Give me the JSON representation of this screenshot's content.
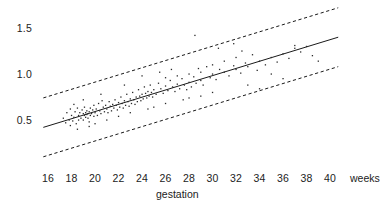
{
  "chart_data": {
    "type": "scatter",
    "title": "",
    "xlabel": "gestation",
    "ylabel": "",
    "x_unit_label": "weeks",
    "xlim": [
      15,
      41.5
    ],
    "ylim": [
      0.2,
      1.62
    ],
    "grid": false,
    "legend": "none",
    "xticks": [
      16,
      18,
      20,
      22,
      24,
      26,
      28,
      30,
      32,
      34,
      36,
      38,
      40
    ],
    "xtick_labels": [
      "16",
      "18",
      "20",
      "22",
      "24",
      "26",
      "28",
      "30",
      "32",
      "34",
      "36",
      "38",
      "40"
    ],
    "yticks": [
      0.5,
      1.0,
      1.5
    ],
    "ytick_labels": [
      "0.5",
      "1.0",
      "1.5"
    ],
    "series": [
      {
        "name": "observations",
        "type": "scatter",
        "marker": "dot",
        "points": [
          [
            17.3,
            0.52
          ],
          [
            17.5,
            0.47
          ],
          [
            17.6,
            0.58
          ],
          [
            17.8,
            0.5
          ],
          [
            17.9,
            0.62
          ],
          [
            17.9,
            0.44
          ],
          [
            18.0,
            0.55
          ],
          [
            18.1,
            0.49
          ],
          [
            18.2,
            0.67
          ],
          [
            18.2,
            0.53
          ],
          [
            18.3,
            0.59
          ],
          [
            18.4,
            0.46
          ],
          [
            18.5,
            0.63
          ],
          [
            18.6,
            0.55
          ],
          [
            18.6,
            0.5
          ],
          [
            18.7,
            0.58
          ],
          [
            18.8,
            0.52
          ],
          [
            18.9,
            0.61
          ],
          [
            19.0,
            0.57
          ],
          [
            19.0,
            0.5
          ],
          [
            19.1,
            0.64
          ],
          [
            19.1,
            0.55
          ],
          [
            19.2,
            0.58
          ],
          [
            19.2,
            0.53
          ],
          [
            19.3,
            0.6
          ],
          [
            19.3,
            0.56
          ],
          [
            19.4,
            0.57
          ],
          [
            19.4,
            0.52
          ],
          [
            19.5,
            0.59
          ],
          [
            19.5,
            0.48
          ],
          [
            19.6,
            0.63
          ],
          [
            19.6,
            0.55
          ],
          [
            19.7,
            0.57
          ],
          [
            19.8,
            0.61
          ],
          [
            19.9,
            0.54
          ],
          [
            19.9,
            0.66
          ],
          [
            20.0,
            0.58
          ],
          [
            20.1,
            0.62
          ],
          [
            20.2,
            0.55
          ],
          [
            20.3,
            0.68
          ],
          [
            20.4,
            0.6
          ],
          [
            20.5,
            0.57
          ],
          [
            20.6,
            0.71
          ],
          [
            20.7,
            0.64
          ],
          [
            20.8,
            0.59
          ],
          [
            20.9,
            0.66
          ],
          [
            21.0,
            0.62
          ],
          [
            21.1,
            0.58
          ],
          [
            21.2,
            0.7
          ],
          [
            21.3,
            0.65
          ],
          [
            21.4,
            0.6
          ],
          [
            21.5,
            0.67
          ],
          [
            21.6,
            0.63
          ],
          [
            21.7,
            0.72
          ],
          [
            21.8,
            0.66
          ],
          [
            21.9,
            0.61
          ],
          [
            22.0,
            0.69
          ],
          [
            22.1,
            0.64
          ],
          [
            22.2,
            0.75
          ],
          [
            22.3,
            0.68
          ],
          [
            22.4,
            0.63
          ],
          [
            22.5,
            0.71
          ],
          [
            22.6,
            0.66
          ],
          [
            22.7,
            0.78
          ],
          [
            22.8,
            0.7
          ],
          [
            22.9,
            0.65
          ],
          [
            23.0,
            0.73
          ],
          [
            23.1,
            0.68
          ],
          [
            23.2,
            0.8
          ],
          [
            23.3,
            0.72
          ],
          [
            23.4,
            0.67
          ],
          [
            23.5,
            0.75
          ],
          [
            23.6,
            0.7
          ],
          [
            23.7,
            0.83
          ],
          [
            23.8,
            0.76
          ],
          [
            23.9,
            0.71
          ],
          [
            24.0,
            0.78
          ],
          [
            24.1,
            0.73
          ],
          [
            24.2,
            0.86
          ],
          [
            24.3,
            0.79
          ],
          [
            24.4,
            0.74
          ],
          [
            24.5,
            0.81
          ],
          [
            24.6,
            0.76
          ],
          [
            24.7,
            0.88
          ],
          [
            24.8,
            0.8
          ],
          [
            24.9,
            0.75
          ],
          [
            25.0,
            0.83
          ],
          [
            25.2,
            0.78
          ],
          [
            25.4,
            0.9
          ],
          [
            25.6,
            0.84
          ],
          [
            25.8,
            0.79
          ],
          [
            26.0,
            0.87
          ],
          [
            26.0,
            0.96
          ],
          [
            26.2,
            0.82
          ],
          [
            26.4,
            0.93
          ],
          [
            26.6,
            0.86
          ],
          [
            26.8,
            0.81
          ],
          [
            27.0,
            0.89
          ],
          [
            27.0,
            0.98
          ],
          [
            27.2,
            0.84
          ],
          [
            27.4,
            0.95
          ],
          [
            27.6,
            0.88
          ],
          [
            27.8,
            0.83
          ],
          [
            28.0,
            0.91
          ],
          [
            28.0,
            1.0
          ],
          [
            28.2,
            0.86
          ],
          [
            28.4,
            0.97
          ],
          [
            28.6,
            0.9
          ],
          [
            28.8,
            1.06
          ],
          [
            29.0,
            0.93
          ],
          [
            29.0,
            1.02
          ],
          [
            29.2,
            0.88
          ],
          [
            29.5,
            1.08
          ],
          [
            29.8,
            0.96
          ],
          [
            30.0,
            1.0
          ],
          [
            30.0,
            1.1
          ],
          [
            30.3,
            0.94
          ],
          [
            30.6,
            1.05
          ],
          [
            31.0,
            1.02
          ],
          [
            31.0,
            1.14
          ],
          [
            31.4,
            0.98
          ],
          [
            31.8,
            1.09
          ],
          [
            32.0,
            1.05
          ],
          [
            32.0,
            1.18
          ],
          [
            32.4,
            1.01
          ],
          [
            32.8,
            1.12
          ],
          [
            33.0,
            1.08
          ],
          [
            33.4,
            1.21
          ],
          [
            33.8,
            1.04
          ],
          [
            34.0,
            1.14
          ],
          [
            34.5,
            1.1
          ],
          [
            35.0,
            1.18
          ],
          [
            35.5,
            1.13
          ],
          [
            36.0,
            1.22
          ],
          [
            36.5,
            1.17
          ],
          [
            37.0,
            1.28
          ],
          [
            37.0,
            1.31
          ],
          [
            37.5,
            1.24
          ],
          [
            38.0,
            1.3
          ],
          [
            38.5,
            1.2
          ],
          [
            39.0,
            1.14
          ],
          [
            28.5,
            1.42
          ],
          [
            31.8,
            1.33
          ],
          [
            30.5,
            1.28
          ],
          [
            24.0,
            0.98
          ],
          [
            22.5,
            0.88
          ],
          [
            20.5,
            0.78
          ],
          [
            19.0,
            0.72
          ],
          [
            25.5,
            1.02
          ],
          [
            26.5,
            1.05
          ],
          [
            23.0,
            0.58
          ],
          [
            24.5,
            0.62
          ],
          [
            26.0,
            0.68
          ],
          [
            27.5,
            0.72
          ],
          [
            29.0,
            0.76
          ],
          [
            21.0,
            0.5
          ],
          [
            22.0,
            0.54
          ],
          [
            25.0,
            0.64
          ],
          [
            28.0,
            0.74
          ],
          [
            30.0,
            0.8
          ],
          [
            33.0,
            0.88
          ],
          [
            34.0,
            0.84
          ],
          [
            18.5,
            0.4
          ],
          [
            19.5,
            0.43
          ],
          [
            20.0,
            0.46
          ],
          [
            32.5,
            1.25
          ],
          [
            35.0,
            1.0
          ],
          [
            36.0,
            0.95
          ]
        ]
      }
    ],
    "lines": [
      {
        "name": "regression-fit",
        "style": "solid",
        "x0": 15.6,
        "y0": 0.42,
        "x1": 40.7,
        "y1": 1.4
      },
      {
        "name": "upper-prediction-band",
        "style": "dashed",
        "x0": 15.6,
        "y0": 0.74,
        "x1": 40.7,
        "y1": 1.72
      },
      {
        "name": "lower-prediction-band",
        "style": "dashed",
        "x0": 15.6,
        "y0": 0.1,
        "x1": 40.7,
        "y1": 1.08
      }
    ]
  }
}
